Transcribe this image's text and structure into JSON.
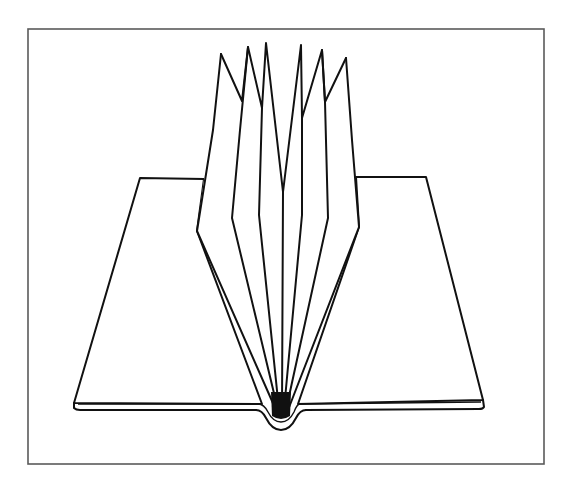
{
  "figure": {
    "colors": {
      "background": "#ffffff",
      "ink": "#111111",
      "frame": "#5a5a5a"
    },
    "frame": {
      "x": 28,
      "y": 29,
      "width": 516,
      "height": 435
    },
    "pages": {
      "left": {
        "top_left": [
          140,
          178
        ],
        "top_right": [
          204,
          179
        ],
        "bottom_left": [
          74,
          403
        ],
        "spine": [
          262,
          404
        ]
      },
      "right": {
        "top_left": [
          356,
          177
        ],
        "top_right": [
          426,
          177
        ],
        "bottom_right": [
          483,
          400
        ],
        "spine": [
          298,
          404
        ]
      }
    },
    "leaves": {
      "count": 7,
      "peaks": [
        [
          221,
          54
        ],
        [
          248,
          47
        ],
        [
          266,
          43
        ],
        [
          301,
          45
        ],
        [
          322,
          50
        ],
        [
          346,
          58
        ]
      ],
      "valleys": [
        [
          242,
          101
        ],
        [
          262,
          108
        ],
        [
          283,
          192
        ],
        [
          302,
          118
        ],
        [
          325,
          102
        ]
      ],
      "convergence_point": [
        280,
        412
      ]
    },
    "top_cut_text": ""
  }
}
